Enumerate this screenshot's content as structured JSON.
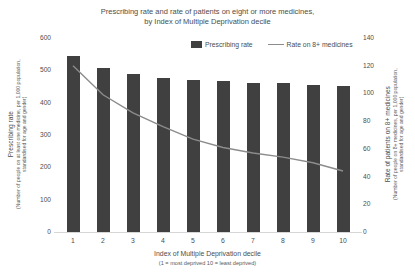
{
  "title": {
    "line1": "Prescribing rate and rate of patients on eight or more medicines,",
    "line2": "by Index of Multiple Deprivation decile"
  },
  "legend": {
    "bar_label": "Prescribing rate",
    "line_label": "Rate on 8+ medicines"
  },
  "left_axis": {
    "title": "Prescribing rate",
    "subtitle_line1": "(Number of people on at least one medicine, per 1,000 population,",
    "subtitle_line2": "standardised for age and gender)",
    "min": 0,
    "max": 600,
    "step": 100
  },
  "right_axis": {
    "title": "Rate of patients on 8+ medicines",
    "subtitle_line1": "(Number of people on 8+ medicines, per 1,000 population,",
    "subtitle_line2": "standardised for age and gender)",
    "min": 0,
    "max": 140,
    "step": 20
  },
  "x_axis": {
    "title": "Index of Multiple Deprivation decile",
    "subtitle": "(1 = most deprived 10 = least deprived)"
  },
  "colors": {
    "bar": "#404040",
    "line": "#8c8c8c",
    "axis_line": "#d6d6d6",
    "text": "#4d4d4d"
  },
  "chart_data": {
    "type": "bar",
    "categories": [
      "1",
      "2",
      "3",
      "4",
      "5",
      "6",
      "7",
      "8",
      "9",
      "10"
    ],
    "series": [
      {
        "name": "Prescribing rate",
        "type": "bar",
        "axis": "left",
        "values": [
          545,
          507,
          490,
          476,
          470,
          468,
          461,
          462,
          456,
          453
        ]
      },
      {
        "name": "Rate on 8+ medicines",
        "type": "line",
        "axis": "right",
        "values": [
          120,
          99,
          86,
          76,
          67,
          61,
          57,
          54,
          50,
          44
        ]
      }
    ],
    "title": "Prescribing rate and rate of patients on eight or more medicines, by Index of Multiple Deprivation decile",
    "xlabel": "Index of Multiple Deprivation decile (1 = most deprived 10 = least deprived)",
    "ylabel_left": "Prescribing rate (Number of people on at least one medicine, per 1,000 population, standardised for age and gender)",
    "ylabel_right": "Rate of patients on 8+ medicines (Number of people on 8+ medicines, per 1,000 population, standardised for age and gender)",
    "ylim_left": [
      0,
      600
    ],
    "ylim_right": [
      0,
      140
    ],
    "grid": false,
    "legend_position": "top-inside"
  }
}
